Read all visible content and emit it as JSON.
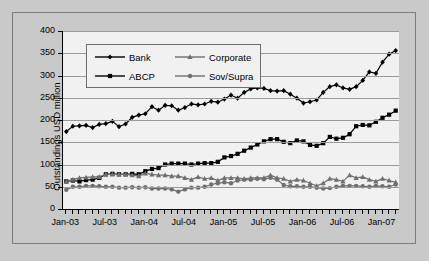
{
  "chart_data": {
    "type": "line",
    "title": "",
    "subtitle": "",
    "xlabel": "",
    "ylabel": "Outstandings USD million",
    "ylim": [
      0,
      400
    ],
    "yticks": [
      0,
      50,
      100,
      150,
      200,
      250,
      300,
      350,
      400
    ],
    "grid": true,
    "legend_position": "top-left-inside",
    "x_tick_labels": [
      "Jan-03",
      "Jul-03",
      "Jan-04",
      "Jul-04",
      "Jan-05",
      "Jul-05",
      "Jan-06",
      "Jul-06",
      "Jan-07"
    ],
    "x_tick_indices": [
      0,
      6,
      12,
      18,
      24,
      30,
      36,
      42,
      48
    ],
    "x": [
      "Jan-03",
      "Feb-03",
      "Mar-03",
      "Apr-03",
      "May-03",
      "Jun-03",
      "Jul-03",
      "Aug-03",
      "Sep-03",
      "Oct-03",
      "Nov-03",
      "Dec-03",
      "Jan-04",
      "Feb-04",
      "Mar-04",
      "Apr-04",
      "May-04",
      "Jun-04",
      "Jul-04",
      "Aug-04",
      "Sep-04",
      "Oct-04",
      "Nov-04",
      "Dec-04",
      "Jan-05",
      "Feb-05",
      "Mar-05",
      "Apr-05",
      "May-05",
      "Jun-05",
      "Jul-05",
      "Aug-05",
      "Sep-05",
      "Oct-05",
      "Nov-05",
      "Dec-05",
      "Jan-06",
      "Feb-06",
      "Mar-06",
      "Apr-06",
      "May-06",
      "Jun-06",
      "Jul-06",
      "Aug-06",
      "Sep-06",
      "Oct-06",
      "Nov-06",
      "Dec-06",
      "Jan-07",
      "Feb-07",
      "Mar-07"
    ],
    "series": [
      {
        "name": "Bank",
        "marker": "diamond",
        "color": "#000000",
        "values": [
          174,
          186,
          187,
          188,
          183,
          190,
          192,
          197,
          185,
          191,
          206,
          211,
          214,
          230,
          222,
          233,
          232,
          222,
          228,
          236,
          234,
          236,
          242,
          240,
          247,
          256,
          249,
          262,
          270,
          272,
          271,
          266,
          265,
          266,
          258,
          249,
          238,
          241,
          245,
          262,
          275,
          279,
          272,
          269,
          275,
          289,
          308,
          305,
          330,
          348,
          356
        ]
      },
      {
        "name": "ABCP",
        "marker": "square",
        "color": "#000000",
        "values": [
          62,
          64,
          62,
          65,
          66,
          70,
          78,
          79,
          78,
          78,
          79,
          78,
          85,
          90,
          92,
          100,
          102,
          102,
          102,
          100,
          102,
          103,
          103,
          106,
          116,
          119,
          124,
          131,
          138,
          145,
          152,
          157,
          157,
          151,
          148,
          154,
          152,
          144,
          142,
          148,
          162,
          158,
          160,
          168,
          186,
          189,
          188,
          196,
          205,
          212,
          221
        ]
      },
      {
        "name": "Corporate",
        "marker": "triangle",
        "color": "#6f6f6f",
        "values": [
          62,
          66,
          70,
          71,
          72,
          72,
          78,
          78,
          78,
          78,
          76,
          74,
          80,
          78,
          76,
          76,
          74,
          74,
          70,
          66,
          72,
          68,
          70,
          64,
          70,
          70,
          70,
          68,
          70,
          70,
          70,
          76,
          70,
          68,
          62,
          66,
          64,
          58,
          52,
          58,
          68,
          66,
          62,
          76,
          70,
          72,
          66,
          62,
          68,
          64,
          60
        ]
      },
      {
        "name": "Sov/Supra",
        "marker": "circle",
        "color": "#6f6f6f",
        "values": [
          43,
          50,
          50,
          52,
          52,
          51,
          50,
          50,
          48,
          48,
          49,
          48,
          49,
          46,
          46,
          46,
          44,
          39,
          44,
          48,
          48,
          50,
          55,
          58,
          60,
          58,
          64,
          66,
          66,
          68,
          67,
          70,
          66,
          54,
          51,
          51,
          50,
          50,
          48,
          46,
          47,
          50,
          52,
          52,
          52,
          51,
          50,
          52,
          51,
          50,
          55
        ]
      }
    ]
  },
  "axes": {
    "y_title": "Outstandings USD million"
  }
}
